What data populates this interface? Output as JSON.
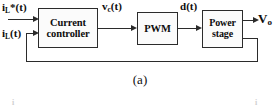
{
  "figure": {
    "caption": "(a)",
    "type": "control-block-diagram"
  },
  "blocks": [
    {
      "id": "current-controller",
      "line1": "Current",
      "line2": "controller"
    },
    {
      "id": "pwm",
      "line1": "PWM",
      "line2": ""
    },
    {
      "id": "power-stage",
      "line1": "Power",
      "line2": "stage"
    }
  ],
  "signals": {
    "current_reference": {
      "base": "i",
      "sub": "L",
      "star": "*",
      "arg": "(t)"
    },
    "current_feedback": {
      "base": "i",
      "sub": "L",
      "star": "",
      "arg": "(t)"
    },
    "control_voltage": {
      "base": "v",
      "sub": "c",
      "star": "",
      "arg": "(t)"
    },
    "duty_cycle": {
      "base": "d",
      "sub": "",
      "star": "",
      "arg": "(t)"
    },
    "output_voltage": {
      "base": "V",
      "sub": "o",
      "star": "",
      "arg": ""
    }
  },
  "remnants": {
    "left": "i",
    "right": "i"
  },
  "colors": {
    "line": "#2b2b2b",
    "text": "#0d0d0d",
    "background": "#ffffff",
    "block_fill": "#fbfbfb"
  }
}
